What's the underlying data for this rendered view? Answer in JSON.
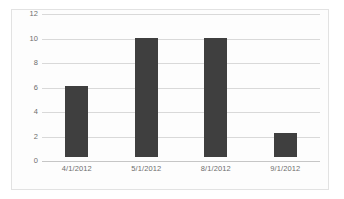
{
  "chart_data": {
    "type": "bar",
    "title": "",
    "subtitle": "",
    "xlabel": "",
    "ylabel": "",
    "categories": [
      "4/1/2012",
      "5/1/2012",
      "8/1/2012",
      "9/1/2012"
    ],
    "values": [
      6,
      10,
      10,
      2
    ],
    "series": [
      {
        "name": "Series 1",
        "values": [
          6,
          10,
          10,
          2
        ],
        "color": "#3f3f3f"
      }
    ],
    "ylim": [
      0,
      12
    ],
    "ytick_labels": [
      "12",
      "10",
      "8",
      "6",
      "4",
      "2",
      "0"
    ],
    "ytick_values": [
      12,
      10,
      8,
      6,
      4,
      2,
      0
    ],
    "grid": true,
    "grid_color": "#d9d9d9",
    "legend": false,
    "legend_position": "none",
    "annotations": [],
    "plot_background": "#fdfdfd",
    "border_color": "#e2e2e2",
    "axis_label_color": "#6d6d6d"
  }
}
